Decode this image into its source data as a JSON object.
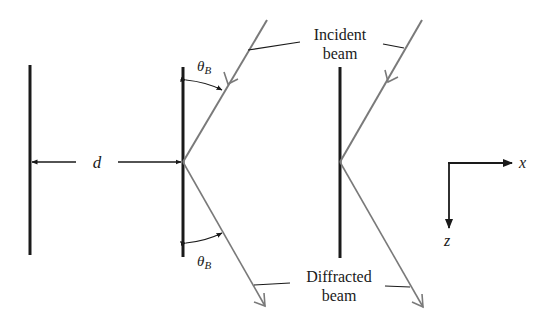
{
  "diagram": {
    "type": "bragg-diffraction-planes",
    "labels": {
      "spacing": "d",
      "theta": "θ",
      "theta_sub": "B",
      "incident_line1": "Incident",
      "incident_line2": "beam",
      "diffracted_line1": "Diffracted",
      "diffracted_line2": "beam",
      "axis_x": "x",
      "axis_z": "z"
    },
    "colors": {
      "plane": "#1a1a1a",
      "beam": "#7a7a7a",
      "text": "#1a1a1a",
      "background": "#ffffff"
    }
  }
}
